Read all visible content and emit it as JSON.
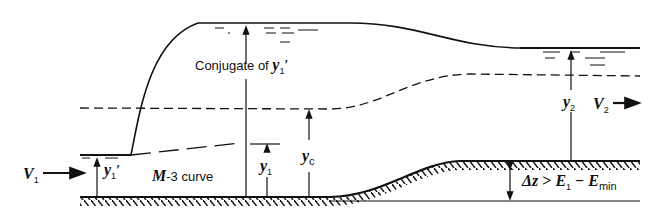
{
  "figure": {
    "colors": {
      "ink": "#111111",
      "background": "#ffffff"
    }
  },
  "labels": {
    "conjugate": "Conjugate of ",
    "conjugate_symbol": "y",
    "conjugate_sub": "1",
    "conjugate_prime": "′",
    "m3_curve_prefix": "M",
    "m3_curve_rest": "-3 curve",
    "v1_symbol": "V",
    "v1_sub": "1",
    "v2_symbol": "V",
    "v2_sub": "2",
    "y1prime_symbol": "y",
    "y1prime_sub": "1",
    "y1prime_prime": "′",
    "y1_symbol": "y",
    "y1_sub": "1",
    "yc_symbol": "y",
    "yc_sub": "c",
    "y2_symbol": "y",
    "y2_sub": "2",
    "dz_text": "Δz ",
    "dz_gt": "> ",
    "e1_symbol": "E",
    "e1_sub": "1",
    "minus": " − ",
    "emin_symbol": "E",
    "emin_sub": "min"
  }
}
